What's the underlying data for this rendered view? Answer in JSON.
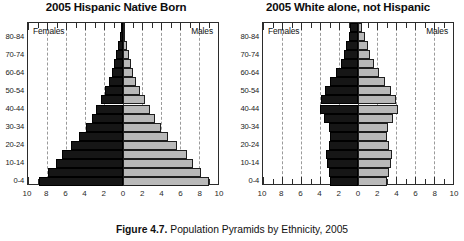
{
  "figure": {
    "caption_label": "Figure 4.7.",
    "caption_text": " Population Pyramids by Ethnicity, 2005"
  },
  "axis": {
    "tick_labels": [
      "10",
      "8",
      "6",
      "4",
      "2",
      "0",
      "2",
      "4",
      "6",
      "8",
      "10"
    ],
    "tick_values": [
      -10,
      -8,
      -6,
      -4,
      -2,
      0,
      2,
      4,
      6,
      8,
      10
    ],
    "age_labels_shown": [
      "80-84",
      "70-74",
      "60-64",
      "50-54",
      "40-44",
      "30-34",
      "20-24",
      "10-14",
      "0-4"
    ],
    "female_label": "Females",
    "male_label": "Males"
  },
  "colors": {
    "female_bar": "#161616",
    "male_bar": "#b9b9b9",
    "axis": "#2b2b2b",
    "gridline": "#9a9a9a",
    "background": "#ffffff"
  },
  "chart_data": [
    {
      "type": "bar",
      "orientation": "population-pyramid",
      "title": "2005 Hispanic Native Born",
      "xlabel": "",
      "ylabel": "",
      "xlim": [
        -10,
        10
      ],
      "grid": true,
      "legend_position": "inside-top-corners",
      "categories": [
        "0-4",
        "5-9",
        "10-14",
        "15-19",
        "20-24",
        "25-29",
        "30-34",
        "35-39",
        "40-44",
        "45-49",
        "50-54",
        "55-59",
        "60-64",
        "65-69",
        "70-74",
        "75-79",
        "80-84",
        "85+"
      ],
      "series": [
        {
          "name": "Females",
          "side": "left",
          "values": [
            8.8,
            7.9,
            7.1,
            6.4,
            5.5,
            4.6,
            3.9,
            3.3,
            2.8,
            2.3,
            1.9,
            1.5,
            1.2,
            0.9,
            0.7,
            0.5,
            0.35,
            0.2
          ]
        },
        {
          "name": "Males",
          "side": "right",
          "values": [
            9.0,
            8.2,
            7.4,
            6.7,
            5.7,
            4.7,
            4.0,
            3.4,
            2.8,
            2.3,
            1.8,
            1.4,
            1.1,
            0.8,
            0.6,
            0.4,
            0.25,
            0.15
          ]
        }
      ]
    },
    {
      "type": "bar",
      "orientation": "population-pyramid",
      "title": "2005 White alone, not Hispanic",
      "xlabel": "",
      "ylabel": "",
      "xlim": [
        -10,
        10
      ],
      "grid": true,
      "legend_position": "inside-top-corners",
      "categories": [
        "0-4",
        "5-9",
        "10-14",
        "15-19",
        "20-24",
        "25-29",
        "30-34",
        "35-39",
        "40-44",
        "45-49",
        "50-54",
        "55-59",
        "60-64",
        "65-69",
        "70-74",
        "75-79",
        "80-84",
        "85+"
      ],
      "series": [
        {
          "name": "Females",
          "side": "left",
          "values": [
            2.9,
            3.1,
            3.3,
            3.4,
            3.1,
            2.9,
            3.1,
            3.6,
            4.0,
            3.9,
            3.5,
            2.9,
            2.3,
            1.8,
            1.5,
            1.3,
            1.0,
            0.8
          ]
        },
        {
          "name": "Males",
          "side": "right",
          "values": [
            3.1,
            3.3,
            3.5,
            3.6,
            3.3,
            3.0,
            3.2,
            3.7,
            4.2,
            4.0,
            3.5,
            2.8,
            2.2,
            1.7,
            1.3,
            1.0,
            0.7,
            0.4
          ]
        }
      ]
    }
  ]
}
